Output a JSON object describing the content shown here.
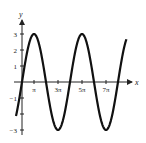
{
  "chart_data": {
    "type": "line",
    "title": "",
    "function": "y = 3 sin(x/2)",
    "xlabel": "x",
    "ylabel": "y",
    "x_ticks": [
      {
        "value_pi": 1,
        "label": "π"
      },
      {
        "value_pi": 3,
        "label": "3π"
      },
      {
        "value_pi": 5,
        "label": "5π"
      },
      {
        "value_pi": 7,
        "label": "7π"
      }
    ],
    "y_ticks": [
      {
        "value": 3,
        "label": "3"
      },
      {
        "value": 2,
        "label": "2"
      },
      {
        "value": 1,
        "label": "1"
      },
      {
        "value": -1,
        "label": "−1"
      },
      {
        "value": -2,
        "label": ""
      },
      {
        "value": -3,
        "label": "−3"
      }
    ],
    "xlim_pi": [
      -0.5,
      8.7
    ],
    "ylim": [
      -3,
      3
    ],
    "grid": false,
    "legend": null,
    "series": [
      {
        "name": "3 sin(x/2)",
        "amplitude": 3,
        "period_pi": 4,
        "x_pi": [
          -0.5,
          0,
          1,
          2,
          3,
          4,
          5,
          6,
          7,
          8,
          8.7
        ],
        "values": [
          -1.15,
          0,
          3,
          0,
          -3,
          0,
          3,
          0,
          -3,
          0,
          1.6
        ]
      }
    ]
  }
}
